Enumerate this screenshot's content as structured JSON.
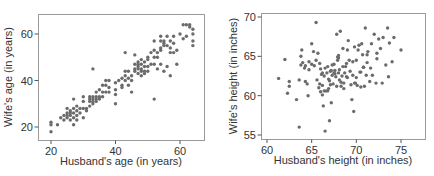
{
  "chart_data": [
    {
      "type": "scatter",
      "title": "",
      "xlabel": "Husband's age (in years)",
      "ylabel": "Wife's age (in years)",
      "xlim": [
        16,
        67
      ],
      "ylim": [
        14,
        68
      ],
      "xticks": [
        20,
        40,
        60
      ],
      "yticks": [
        20,
        40,
        60
      ],
      "grid": false,
      "point_color": "#6b6b6b",
      "frame": {
        "left": 38,
        "top": 14,
        "right": 204,
        "bottom": 140
      },
      "pixel_map": {
        "x0": 20,
        "x0px": 51,
        "x1": 60,
        "x1px": 180,
        "y0": 20,
        "y0px": 127,
        "y1": 60,
        "y1px": 34
      },
      "x": [
        20,
        20,
        20,
        22,
        23,
        24,
        24,
        25,
        25,
        25,
        25,
        26,
        26,
        26,
        26,
        27,
        27,
        27,
        27,
        27,
        28,
        28,
        28,
        28,
        29,
        29,
        30,
        30,
        30,
        30,
        31,
        31,
        32,
        32,
        32,
        32,
        33,
        33,
        33,
        33,
        34,
        34,
        34,
        34,
        35,
        35,
        35,
        36,
        36,
        36,
        37,
        37,
        37,
        38,
        38,
        38,
        40,
        40,
        40,
        40,
        41,
        42,
        42,
        42,
        43,
        43,
        43,
        44,
        44,
        44,
        45,
        45,
        45,
        46,
        46,
        46,
        46,
        47,
        47,
        47,
        47,
        47,
        48,
        48,
        48,
        48,
        48,
        49,
        49,
        49,
        49,
        50,
        50,
        50,
        50,
        51,
        51,
        52,
        52,
        52,
        52,
        53,
        53,
        53,
        54,
        54,
        54,
        54,
        54,
        55,
        55,
        55,
        55,
        56,
        56,
        56,
        57,
        57,
        57,
        57,
        58,
        58,
        58,
        59,
        59,
        60,
        61,
        61,
        62,
        62,
        63,
        63,
        64,
        64,
        64,
        64,
        33,
        43,
        52
      ],
      "y": [
        22,
        21,
        18,
        21,
        24,
        23,
        25,
        26,
        24,
        28,
        25,
        25,
        27,
        23,
        26,
        24,
        28,
        32,
        21,
        26,
        25,
        27,
        23,
        29,
        26,
        28,
        28,
        31,
        33,
        24,
        27,
        28,
        31,
        29,
        32,
        33,
        31,
        33,
        30,
        32,
        33,
        32,
        35,
        31,
        33,
        36,
        32,
        35,
        33,
        38,
        35,
        38,
        40,
        35,
        40,
        37,
        39,
        34,
        30,
        36,
        40,
        38,
        37,
        41,
        40,
        44,
        42,
        41,
        38,
        44,
        40,
        35,
        42,
        45,
        47,
        51,
        44,
        47,
        48,
        46,
        43,
        45,
        45,
        47,
        49,
        44,
        42,
        44,
        46,
        43,
        48,
        44,
        46,
        50,
        49,
        47,
        52,
        47,
        53,
        57,
        50,
        45,
        50,
        52,
        59,
        57,
        53,
        54,
        47,
        44,
        56,
        57,
        55,
        46,
        59,
        55,
        54,
        57,
        52,
        42,
        59,
        52,
        56,
        47,
        53,
        60,
        58,
        64,
        64,
        59,
        63,
        64,
        60,
        62,
        57,
        55,
        45,
        52,
        32
      ]
    },
    {
      "type": "scatter",
      "title": "",
      "xlabel": "Husband's height (in inches)",
      "ylabel": "Wife's height (in inches)",
      "xlim": [
        59.4,
        77.5
      ],
      "ylim": [
        54.4,
        70.3
      ],
      "xticks": [
        60,
        65,
        70,
        75
      ],
      "yticks": [
        55,
        60,
        65,
        70
      ],
      "grid": false,
      "point_color": "#6b6b6b",
      "frame": {
        "left": 261,
        "top": 13,
        "right": 425,
        "bottom": 139
      },
      "pixel_map": {
        "x0": 60,
        "x0px": 267,
        "x1": 75,
        "x1px": 401,
        "y0": 55,
        "y0px": 135,
        "y1": 70,
        "y1px": 17
      },
      "x": [
        61.3,
        62.0,
        62.3,
        62.5,
        62.5,
        63.3,
        63.6,
        63.8,
        63.9,
        64.0,
        64.2,
        64.3,
        64.5,
        64.6,
        64.7,
        65.0,
        65.0,
        65.2,
        65.3,
        65.5,
        65.6,
        65.7,
        65.8,
        65.9,
        66.0,
        66.0,
        66.1,
        66.2,
        66.2,
        66.3,
        66.4,
        66.5,
        66.5,
        66.6,
        66.7,
        66.8,
        66.9,
        67.0,
        67.0,
        67.1,
        67.2,
        67.3,
        67.3,
        67.4,
        67.5,
        67.5,
        67.6,
        67.7,
        67.8,
        67.8,
        67.9,
        68.0,
        68.0,
        68.1,
        68.1,
        68.2,
        68.3,
        68.4,
        68.5,
        68.5,
        68.6,
        68.7,
        68.8,
        68.9,
        69.0,
        69.0,
        69.1,
        69.2,
        69.3,
        69.4,
        69.5,
        69.6,
        69.7,
        69.8,
        69.9,
        70.0,
        70.0,
        70.1,
        70.2,
        70.3,
        70.4,
        70.5,
        70.6,
        70.7,
        70.8,
        70.9,
        71.0,
        71.1,
        71.2,
        71.3,
        71.5,
        71.6,
        71.7,
        71.8,
        72.0,
        72.2,
        72.3,
        72.5,
        72.7,
        72.9,
        73.0,
        73.3,
        73.5,
        73.7,
        74.0,
        74.2,
        75.0,
        65.5,
        66.2,
        63.6,
        66.9,
        67.6,
        68.0,
        69.8,
        67.2,
        66.8,
        68.9,
        70.5,
        71.2,
        73.6,
        64.7,
        63.8,
        66.4,
        65.9,
        67.9,
        68.3,
        69.6,
        70.8,
        72.3,
        64.3,
        67.1,
        68.6
      ],
      "y": [
        62.2,
        64.6,
        60.3,
        61.2,
        61.8,
        59.5,
        56.0,
        65.0,
        65.8,
        64.2,
        63.5,
        61.8,
        61.5,
        60.0,
        64.3,
        66.6,
        64.0,
        65.6,
        63.8,
        69.3,
        62.0,
        65.4,
        61.0,
        64.1,
        63.4,
        60.5,
        62.7,
        60.1,
        61.3,
        58.7,
        62.5,
        63.5,
        55.5,
        60.6,
        62.9,
        63.7,
        62.1,
        56.8,
        61.9,
        63.1,
        59.1,
        62.6,
        63.9,
        61.5,
        62.9,
        64.0,
        63.2,
        62.4,
        67.8,
        61.2,
        64.9,
        62.9,
        65.1,
        63.3,
        62.0,
        68.2,
        61.7,
        62.5,
        66.0,
        63.7,
        60.9,
        62.9,
        63.7,
        64.1,
        65.8,
        62.3,
        67.0,
        64.5,
        63.1,
        61.4,
        59.5,
        62.6,
        58.0,
        66.2,
        61.6,
        64.5,
        62.3,
        61.3,
        65.8,
        66.4,
        63.0,
        61.1,
        66.6,
        65.2,
        63.6,
        61.2,
        68.6,
        62.6,
        64.2,
        65.6,
        61.8,
        63.5,
        66.6,
        62.6,
        67.8,
        61.6,
        64.7,
        67.2,
        66.0,
        61.6,
        67.4,
        63.9,
        68.6,
        66.7,
        64.3,
        67.4,
        65.8,
        64.5,
        62.9,
        62.0,
        60.9,
        62.8,
        64.8,
        61.6,
        63.2,
        60.6,
        62.4,
        63.0,
        65.2,
        62.4,
        63.3,
        63.9,
        60.6,
        61.5,
        64.5,
        61.2,
        64.3,
        63.6,
        65.4,
        63.8,
        61.4,
        61.6,
        62.7
      ]
    }
  ]
}
